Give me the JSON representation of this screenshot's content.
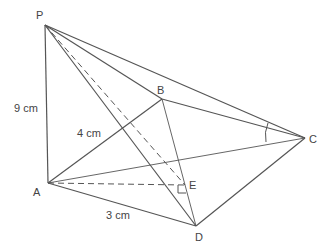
{
  "diagram": {
    "points": {
      "P": {
        "label": "P"
      },
      "A": {
        "label": "A"
      },
      "B": {
        "label": "B"
      },
      "C": {
        "label": "C"
      },
      "D": {
        "label": "D"
      },
      "E": {
        "label": "E"
      }
    },
    "measurements": {
      "PA": "9 cm",
      "AB": "4 cm",
      "AD": "3 cm"
    }
  }
}
